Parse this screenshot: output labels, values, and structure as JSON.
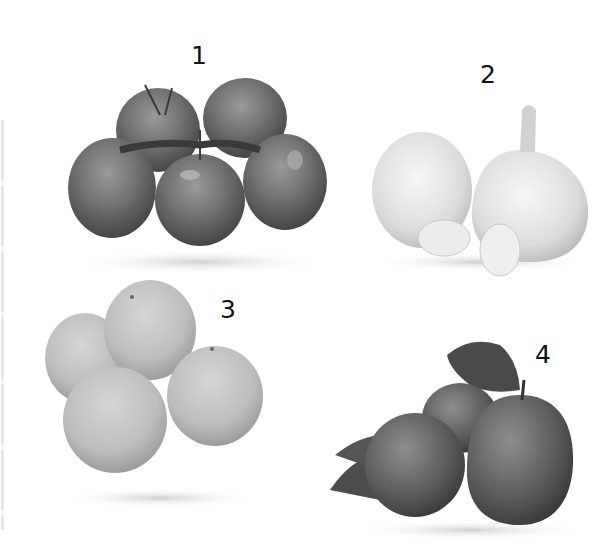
{
  "figure": {
    "items": [
      {
        "number": "1",
        "subject": "tomatoes on the vine",
        "count": 5
      },
      {
        "number": "2",
        "subject": "garlic bulbs and cloves",
        "count": 2
      },
      {
        "number": "3",
        "subject": "oranges",
        "count": 5
      },
      {
        "number": "4",
        "subject": "apples with leaves",
        "count": 3
      }
    ],
    "colors": {
      "background": "#ffffff",
      "label": "#111111",
      "tomato": "#6f6f6f",
      "garlic": "#dedede",
      "orange": "#bdbdbd",
      "apple": "#5e5e5e"
    }
  }
}
